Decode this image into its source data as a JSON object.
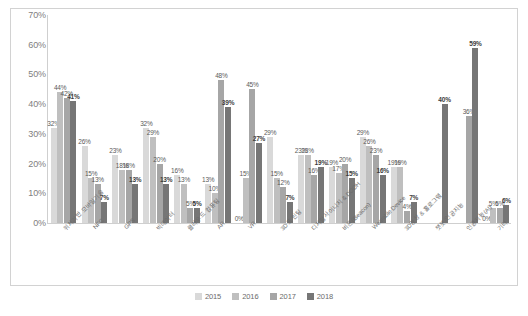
{
  "chart_data": {
    "type": "bar",
    "title": "",
    "xlabel": "",
    "ylabel": "",
    "ylim": [
      0,
      70
    ],
    "y_ticks": [
      0,
      10,
      20,
      30,
      40,
      50,
      60,
      70
    ],
    "y_tick_labels": [
      "0%",
      "10%",
      "20%",
      "30%",
      "40%",
      "50%",
      "60%",
      "70%"
    ],
    "grid": false,
    "legend_position": "bottom",
    "value_suffix": "%",
    "categories": [
      "위치기반 모바일기술",
      "NFC",
      "GPS",
      "빅데이터",
      "클라우드 컴퓨팅",
      "AR",
      "VR",
      "3D 프린팅",
      "디지털사이니지 & DOOH",
      "비콘(iBeacon)",
      "Wearable Device",
      "3D영상 & 홀로그램",
      "챗봇/인공지능",
      "인공지능(AI)",
      "기타"
    ],
    "series": [
      {
        "name": "2015",
        "color": "#d9d9d9",
        "values": [
          32,
          26,
          23,
          32,
          16,
          13,
          0,
          29,
          23,
          19,
          29,
          19,
          null,
          null,
          0
        ]
      },
      {
        "name": "2016",
        "color": "#bfbfbf",
        "values": [
          44,
          15,
          18,
          29,
          13,
          10,
          15,
          15,
          23,
          17,
          26,
          19,
          null,
          null,
          5
        ]
      },
      {
        "name": "2017",
        "color": "#a6a6a6",
        "values": [
          42,
          13,
          18,
          20,
          5,
          48,
          45,
          12,
          16,
          20,
          23,
          4,
          null,
          36,
          5
        ]
      },
      {
        "name": "2018",
        "color": "#767676",
        "values": [
          41,
          7,
          13,
          13,
          5,
          39,
          27,
          7,
          19,
          15,
          16,
          7,
          40,
          59,
          6
        ]
      }
    ],
    "bold_series": "2018",
    "data_labels": {
      "위치기반 모바일기술": [
        "32%",
        "44%",
        "42%",
        "41%"
      ],
      "NFC": [
        "26%",
        "15%",
        "13%",
        "7%"
      ],
      "GPS": [
        "23%",
        "18%",
        "18%",
        "13%"
      ],
      "빅데이터": [
        "32%",
        "29%",
        "20%",
        "13%"
      ],
      "클라우드 컴퓨팅": [
        "16%",
        "13%",
        "5%",
        "5%"
      ],
      "AR": [
        "13%",
        "10%",
        "48%",
        "39%"
      ],
      "VR": [
        "0%",
        "15%",
        "45%",
        "27%"
      ],
      "3D 프린팅": [
        "29%",
        "15%",
        "12%",
        "7%"
      ],
      "디지털사이니지 & DOOH": [
        "23%",
        "23%",
        "16%",
        "19%"
      ],
      "비콘(iBeacon)": [
        "19%",
        "17%",
        "20%",
        "15%"
      ],
      "Wearable Device": [
        "29%",
        "26%",
        "23%",
        "16%"
      ],
      "3D영상 & 홀로그램": [
        "19%",
        "19%",
        "4%",
        "7%"
      ],
      "챗봇/인공지능": [
        "",
        "",
        "",
        "40%"
      ],
      "인공지능(AI)": [
        "",
        "",
        "36%",
        "59%"
      ],
      "기타": [
        "0%",
        "5%",
        "5%",
        "6%"
      ]
    }
  },
  "legend": {
    "items": [
      {
        "label": "2015",
        "color": "#d9d9d9"
      },
      {
        "label": "2016",
        "color": "#bfbfbf"
      },
      {
        "label": "2017",
        "color": "#a6a6a6"
      },
      {
        "label": "2018",
        "color": "#767676"
      }
    ]
  }
}
